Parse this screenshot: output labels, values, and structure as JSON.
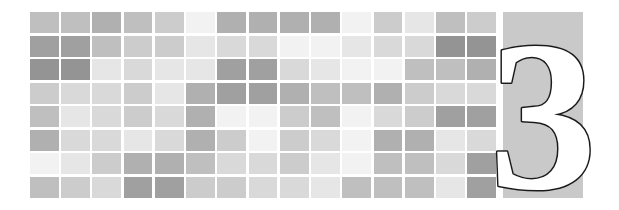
{
  "banner": {
    "type": "chapter-opener",
    "width": 619,
    "height": 210,
    "background_color": "#ffffff"
  },
  "chapter_number": {
    "label": "3",
    "fill_color": "#ffffff",
    "outline_color": "#1a1a1a",
    "panel_color": "#c9c9c9"
  },
  "mosaic": {
    "columns": 15,
    "rows": 8,
    "gap_color": "#ffffff",
    "palette": {
      "a": "#f2f2f2",
      "b": "#e6e6e6",
      "c": "#d9d9d9",
      "d": "#cccccc",
      "e": "#bfbfbf",
      "f": "#b0b0b0",
      "g": "#a0a0a0",
      "h": "#949494"
    },
    "grid": [
      [
        "e",
        "e",
        "f",
        "e",
        "d",
        "a",
        "f",
        "f",
        "f",
        "f",
        "a",
        "d",
        "b",
        "e",
        "d"
      ],
      [
        "g",
        "g",
        "e",
        "d",
        "d",
        "b",
        "c",
        "c",
        "a",
        "a",
        "b",
        "c",
        "c",
        "h",
        "h"
      ],
      [
        "h",
        "h",
        "b",
        "c",
        "b",
        "b",
        "g",
        "g",
        "c",
        "b",
        "a",
        "a",
        "e",
        "e",
        "f"
      ],
      [
        "d",
        "c",
        "c",
        "d",
        "b",
        "f",
        "g",
        "g",
        "f",
        "e",
        "e",
        "f",
        "d",
        "c",
        "c"
      ],
      [
        "e",
        "b",
        "c",
        "d",
        "c",
        "f",
        "a",
        "a",
        "d",
        "e",
        "a",
        "c",
        "d",
        "g",
        "g"
      ],
      [
        "f",
        "c",
        "c",
        "b",
        "c",
        "f",
        "d",
        "a",
        "d",
        "c",
        "a",
        "f",
        "f",
        "b",
        "c"
      ],
      [
        "a",
        "b",
        "d",
        "f",
        "f",
        "e",
        "c",
        "c",
        "d",
        "b",
        "a",
        "e",
        "e",
        "c",
        "g"
      ],
      [
        "e",
        "d",
        "c",
        "g",
        "g",
        "d",
        "d",
        "c",
        "c",
        "b",
        "e",
        "e",
        "e",
        "b",
        "g"
      ]
    ]
  }
}
